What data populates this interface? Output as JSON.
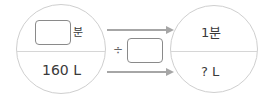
{
  "left_circle": {
    "top_unit": "분",
    "bottom_value": "160 L"
  },
  "operator": {
    "symbol": "÷"
  },
  "right_circle": {
    "top_value": "1분",
    "bottom_value": "? L"
  },
  "colors": {
    "circle_border": "#cfcfcf",
    "arrow": "#a6a6a6",
    "box_border": "#8a8a8a",
    "text": "#3a3a3a"
  }
}
